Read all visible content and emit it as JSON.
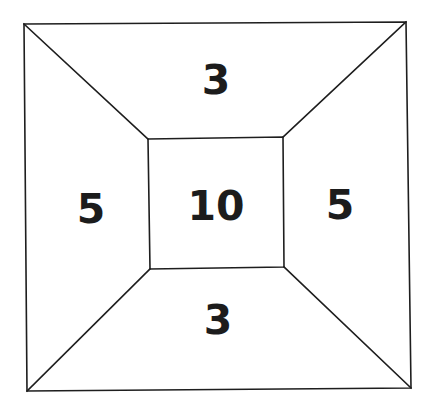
{
  "diagram": {
    "type": "frustum-square-partition",
    "colors": {
      "background": "#ffffff",
      "stroke": "#1e1e1e",
      "text": "#1c1c1c"
    },
    "outer_square": {
      "top_left": [
        24,
        24
      ],
      "top_right": [
        406,
        22
      ],
      "bottom_right": [
        411,
        388
      ],
      "bottom_left": [
        27,
        391
      ]
    },
    "inner_square": {
      "top_left": [
        148,
        139
      ],
      "top_right": [
        283,
        137
      ],
      "bottom_right": [
        284,
        267
      ],
      "bottom_left": [
        150,
        269
      ]
    },
    "regions": [
      {
        "id": "top",
        "label": "3",
        "position": [
          216,
          80
        ]
      },
      {
        "id": "left",
        "label": "5",
        "position": [
          91,
          209
        ]
      },
      {
        "id": "center",
        "label": "10",
        "position": [
          216,
          206
        ]
      },
      {
        "id": "right",
        "label": "5",
        "position": [
          340,
          205
        ]
      },
      {
        "id": "bottom",
        "label": "3",
        "position": [
          218,
          320
        ]
      }
    ]
  }
}
